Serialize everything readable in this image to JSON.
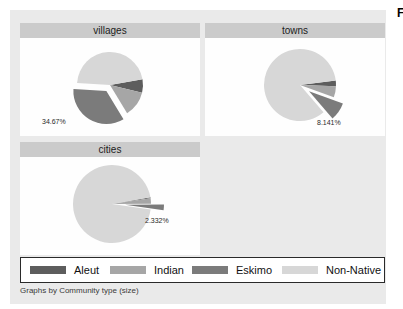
{
  "page": {
    "fragment_right": "F"
  },
  "caption": "Graphs by Community type (size)",
  "legend": {
    "items": [
      {
        "label": "Aleut",
        "color": "#5d5d5d"
      },
      {
        "label": "Indian",
        "color": "#a6a6a6"
      },
      {
        "label": "Eskimo",
        "color": "#7b7b7b"
      },
      {
        "label": "Non-Native",
        "color": "#d7d7d7"
      }
    ]
  },
  "chart_data": [
    {
      "type": "pie",
      "title": "villages",
      "start_angle": 10,
      "exploded_slice": "Eskimo",
      "slice_label": "34.67%",
      "slices": [
        {
          "name": "Aleut",
          "pct": 6.6
        },
        {
          "name": "Indian",
          "pct": 12.5
        },
        {
          "name": "Eskimo",
          "pct": 34.67,
          "label": "34.67%"
        },
        {
          "name": "Non-Native",
          "pct": 46.23
        }
      ]
    },
    {
      "type": "pie",
      "title": "towns",
      "start_angle": 7,
      "exploded_slice": "Eskimo",
      "slice_label": "8.141%",
      "slices": [
        {
          "name": "Aleut",
          "pct": 2.5
        },
        {
          "name": "Indian",
          "pct": 5.0
        },
        {
          "name": "Eskimo",
          "pct": 8.141,
          "label": "8.141%"
        },
        {
          "name": "Non-Native",
          "pct": 84.359
        }
      ]
    },
    {
      "type": "pie",
      "title": "cities",
      "start_angle": 10,
      "exploded_slice": "Eskimo",
      "slice_label": "2.332%",
      "slices": [
        {
          "name": "Aleut",
          "pct": 0.45
        },
        {
          "name": "Indian",
          "pct": 2.2
        },
        {
          "name": "Eskimo",
          "pct": 2.332,
          "label": "2.332%"
        },
        {
          "name": "Non-Native",
          "pct": 95.018
        }
      ]
    }
  ]
}
